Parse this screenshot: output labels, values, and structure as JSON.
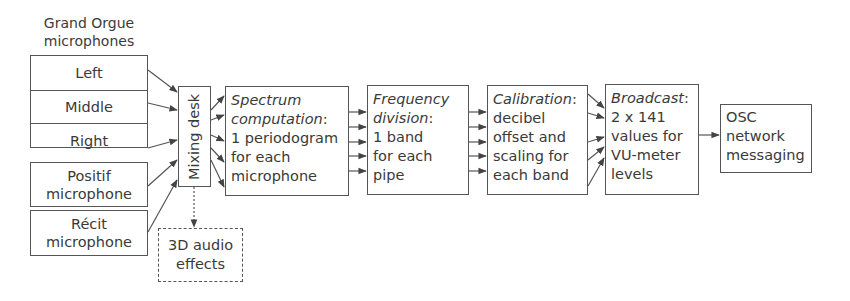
{
  "diagram": {
    "source_group": {
      "title_line1": "Grand Orgue",
      "title_line2": "microphones",
      "channels": [
        "Left",
        "Middle",
        "Right"
      ]
    },
    "extra_sources": [
      {
        "line1": "Positif",
        "line2": "microphone"
      },
      {
        "line1": "Récit",
        "line2": "microphone"
      }
    ],
    "mixing_desk": {
      "label": "Mixing desk"
    },
    "audio_effects": {
      "line1": "3D audio",
      "line2": "effects",
      "style": "dashed"
    },
    "stages": [
      {
        "title": "Spectrum",
        "title2": "computation",
        "suffix": ":",
        "lines": [
          "1 periodogram",
          "for each",
          "microphone"
        ]
      },
      {
        "title": "Frequency",
        "title2": "division",
        "suffix": ":",
        "lines": [
          "1 band",
          "for each",
          "pipe"
        ]
      },
      {
        "title": "Calibration",
        "suffix": ":",
        "lines": [
          "decibel",
          "offset and",
          "scaling for",
          "each band"
        ]
      },
      {
        "title": "Broadcast",
        "suffix": ":",
        "lines": [
          "2 x 141",
          "values for",
          "VU-meter",
          "levels"
        ]
      }
    ],
    "output": {
      "lines": [
        "OSC",
        "network",
        "messaging"
      ]
    },
    "colors": {
      "stroke": "#555555",
      "text": "#3a3a3a",
      "background": "#ffffff"
    }
  }
}
